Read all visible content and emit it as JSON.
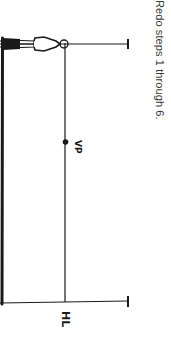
{
  "instruction": "Redo steps 1 through 6.",
  "labels": {
    "vanishing_point": "VP",
    "horizon_line": "HL"
  },
  "colors": {
    "ink": "#1a1a1a",
    "text": "#3a3a3a",
    "background": "#ffffff"
  }
}
